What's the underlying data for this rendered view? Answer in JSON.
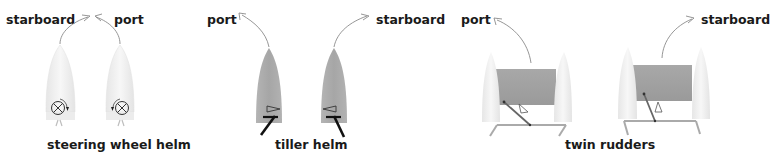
{
  "diagram": {
    "panels": [
      {
        "id": "steering-wheel",
        "caption": "steering wheel helm",
        "left_label": "starboard",
        "right_label": "port"
      },
      {
        "id": "tiller",
        "caption": "tiller helm",
        "left_label": "port",
        "right_label": "starboard"
      },
      {
        "id": "twin-rudders",
        "caption": "twin rudders",
        "left_label": "port",
        "right_label": "starboard"
      }
    ],
    "colors": {
      "hull_light": "#f1f1f1",
      "hull_dark": "#a9a9a9",
      "deck": "#a0a0a0",
      "arrow": "#8a8a8a",
      "text": "#1a1a1a"
    }
  }
}
